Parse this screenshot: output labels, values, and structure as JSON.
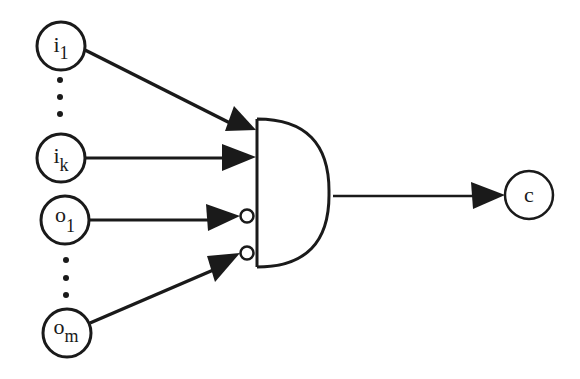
{
  "diagram": {
    "type": "logic-gate",
    "gate": {
      "name": "AND gate",
      "shape": "and",
      "negated_inputs": [
        "o_1",
        "o_m"
      ]
    },
    "inputs": [
      {
        "id": "i1",
        "base": "i",
        "sub": "1",
        "negated": false
      },
      {
        "id": "ik",
        "base": "i",
        "sub": "k",
        "negated": false
      },
      {
        "id": "o1",
        "base": "o",
        "sub": "1",
        "negated": true
      },
      {
        "id": "om",
        "base": "o",
        "sub": "m",
        "negated": true
      }
    ],
    "output": {
      "id": "c",
      "label": "c"
    },
    "ellipsis": [
      "between i_1 and i_k",
      "between o_1 and o_m"
    ],
    "colors": {
      "stroke": "#1a1a1a",
      "background": "#ffffff"
    }
  }
}
